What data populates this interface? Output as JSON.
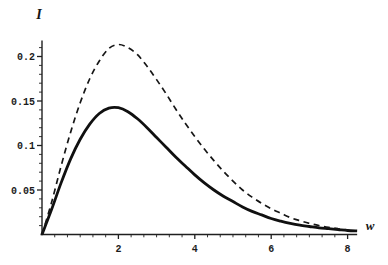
{
  "figure": {
    "background": "#ffffff",
    "axis_color": "#1f1f1f",
    "tick_label_color": "#1c1c1c"
  },
  "chart_data": {
    "type": "line",
    "title": "",
    "xlabel": "w",
    "ylabel": "I",
    "xlim": [
      0,
      8.25
    ],
    "ylim": [
      0,
      0.218
    ],
    "grid": false,
    "legend": "none",
    "x_ticks": [
      2,
      4,
      6,
      8
    ],
    "x_tick_labels": [
      "2",
      "4",
      "6",
      "8"
    ],
    "x_minor_step": 0.3333,
    "y_ticks": [
      0.05,
      0.1,
      0.15,
      0.2
    ],
    "y_tick_labels": [
      "0.05",
      "0.1",
      "0.15",
      "0.2"
    ],
    "y_minor_step": 0.01,
    "series": [
      {
        "name": "solid-curve",
        "style": "solid",
        "color": "#101010",
        "width": 2.8,
        "peak": {
          "x": 1.9,
          "y": 0.143
        },
        "x": [
          0,
          0.25,
          0.5,
          0.75,
          1.0,
          1.25,
          1.5,
          1.75,
          2.0,
          2.25,
          2.5,
          2.75,
          3.0,
          3.25,
          3.5,
          3.75,
          4.0,
          4.25,
          4.5,
          4.75,
          5.0,
          5.25,
          5.5,
          5.75,
          6.0,
          6.25,
          6.5,
          6.75,
          7.0,
          7.25,
          7.5,
          7.75,
          8.0,
          8.25
        ],
        "y": [
          0,
          0.028,
          0.058,
          0.085,
          0.107,
          0.124,
          0.136,
          0.142,
          0.1425,
          0.138,
          0.13,
          0.12,
          0.109,
          0.098,
          0.087,
          0.077,
          0.067,
          0.058,
          0.05,
          0.043,
          0.037,
          0.031,
          0.026,
          0.022,
          0.018,
          0.015,
          0.0125,
          0.0105,
          0.009,
          0.0075,
          0.0065,
          0.0055,
          0.0045,
          0.004
        ]
      },
      {
        "name": "dashed-curve",
        "style": "dashed",
        "color": "#161616",
        "width": 1.7,
        "dash": [
          6,
          4.5
        ],
        "peak": {
          "x": 1.95,
          "y": 0.213
        },
        "x": [
          0,
          0.25,
          0.5,
          0.75,
          1.0,
          1.25,
          1.5,
          1.75,
          2.0,
          2.25,
          2.5,
          2.75,
          3.0,
          3.25,
          3.5,
          3.75,
          4.0,
          4.25,
          4.5,
          4.75,
          5.0,
          5.25,
          5.5,
          5.75,
          6.0,
          6.25,
          6.5,
          6.75,
          7.0,
          7.25,
          7.5,
          7.75,
          8.0
        ],
        "y": [
          0,
          0.036,
          0.077,
          0.115,
          0.148,
          0.175,
          0.195,
          0.209,
          0.2135,
          0.21,
          0.202,
          0.189,
          0.174,
          0.158,
          0.141,
          0.125,
          0.11,
          0.096,
          0.083,
          0.071,
          0.06,
          0.05,
          0.042,
          0.035,
          0.029,
          0.024,
          0.019,
          0.0155,
          0.0125,
          0.01,
          0.008,
          0.0065,
          0.005
        ]
      }
    ]
  }
}
